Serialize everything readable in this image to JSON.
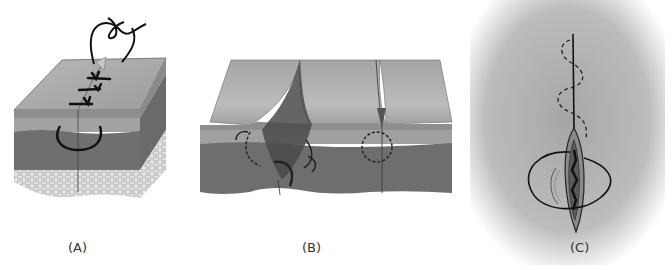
{
  "figure": {
    "panels": [
      {
        "id": "A",
        "label": "(A)",
        "description": "Skin block with sutured incision, thread loops and knots on surface, curved needle path through dermis"
      },
      {
        "id": "B",
        "label": "(B)",
        "description": "Skin cross-section showing everted wound edge with curved arrows and dashed circular suture path"
      },
      {
        "id": "C",
        "label": "(C)",
        "description": "Top view of elliptical wound with dashed running suture and looped thread on gray background"
      }
    ],
    "colors": {
      "epidermis_top": "#a8a8a8",
      "dermis_light": "#9a9a9a",
      "dermis_dark": "#6e6e6e",
      "fat_layer": "#dcdcdc",
      "thread": "#1a1a1a",
      "panel_c_bg": "#b4b4b4"
    }
  }
}
